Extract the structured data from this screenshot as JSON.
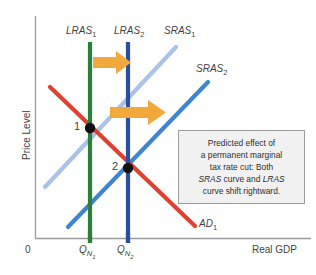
{
  "figure": {
    "type": "economics-as-ad-diagram",
    "width": 316,
    "height": 275,
    "background": "#ffffff"
  },
  "axes": {
    "y_label": "Price Level",
    "x_label": "Real GDP",
    "origin_label": "0",
    "axis_color": "#9a9a9a",
    "x_ticks": [
      {
        "label_main": "Q",
        "label_sub": "N1",
        "x": 90,
        "color": "#2f7d3a"
      },
      {
        "label_main": "Q",
        "label_sub": "N2",
        "x": 128,
        "color": "#2b4fa0"
      }
    ]
  },
  "curves": [
    {
      "id": "lras1",
      "name": "LRAS1",
      "label_main": "LRAS",
      "label_sub": "1",
      "color": "#2f7d3a",
      "kind": "vertical",
      "label_x": 66,
      "label_y": 30
    },
    {
      "id": "lras2",
      "name": "LRAS2",
      "label_main": "LRAS",
      "label_sub": "2",
      "color": "#2b4fa0",
      "kind": "vertical",
      "label_x": 114,
      "label_y": 30
    },
    {
      "id": "sras1",
      "name": "SRAS1",
      "label_main": "SRAS",
      "label_sub": "1",
      "color": "#a9c2e8",
      "kind": "upward-sloping",
      "label_x": 165,
      "label_y": 30
    },
    {
      "id": "sras2",
      "name": "SRAS2",
      "label_main": "SRAS",
      "label_sub": "2",
      "color": "#3d85d0",
      "kind": "upward-sloping",
      "label_x": 196,
      "label_y": 67
    },
    {
      "id": "ad1",
      "name": "AD1",
      "label_main": "AD",
      "label_sub": "1",
      "color": "#e0402f",
      "kind": "downward-sloping",
      "label_x": 198,
      "label_y": 222
    }
  ],
  "equilibria": [
    {
      "label": "1",
      "x": 90,
      "y": 128,
      "label_x": 75,
      "label_y": 122
    },
    {
      "label": "2",
      "x": 128,
      "y": 168,
      "label_x": 113,
      "label_y": 162
    }
  ],
  "arrows": {
    "color": "#f2a93b",
    "items": [
      {
        "id": "lras-shift-arrow",
        "name": "lras-shift-arrow",
        "x": 93,
        "y": 62
      },
      {
        "id": "sras-shift-arrow",
        "name": "sras-shift-arrow",
        "x": 110,
        "y": 112
      }
    ]
  },
  "callout": {
    "line1": "Predicted effect of",
    "line2": "a permanent marginal",
    "line3": "tax rate cut: Both",
    "line4_a": "SRAS",
    "line4_b": " curve and ",
    "line4_c": "LRAS",
    "line5": "curve shift rightward.",
    "background": "#f1f1f1",
    "border_color": "#9a9a9a"
  }
}
